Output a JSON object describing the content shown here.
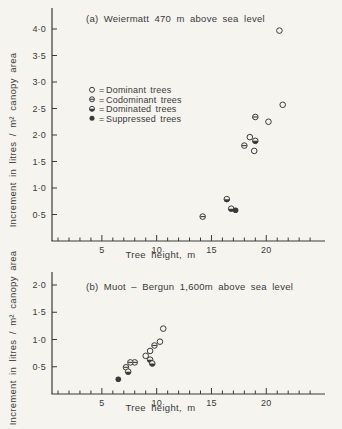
{
  "figure": {
    "background": "#f5f4ef",
    "ink": "#3a3a3a",
    "caption": "Increment per canopy area versus tree height at two elevations"
  },
  "chart_data": [
    {
      "id": "weiermatt",
      "type": "scatter",
      "title": "(a) Weiermatt 470 m above sea level",
      "xlabel": "Tree height, m",
      "ylabel": "Increment in litres / m² canopy area",
      "xlim": [
        0,
        25
      ],
      "ylim": [
        0,
        4.4
      ],
      "xticks": [
        5,
        10,
        15,
        20
      ],
      "xtick_minor_step": 1,
      "xtick_minor_max": 24,
      "yticks": [
        0.5,
        1.0,
        1.5,
        2.0,
        2.5,
        3.0,
        3.5,
        4.0
      ],
      "ytick_labels": [
        "0·5",
        "1·0",
        "1·5",
        "2·0",
        "2·5",
        "3·0",
        "3·5",
        "4·0"
      ],
      "grid": false,
      "legend": {
        "visible": true,
        "position": "upper-left-inside",
        "equals_sign": "=",
        "entries": [
          {
            "marker": "open-circle",
            "label": "Dominant trees"
          },
          {
            "marker": "circle-horizontal-bar",
            "label": "Codominant trees"
          },
          {
            "marker": "circle-bottom-half-filled",
            "label": "Dominated trees"
          },
          {
            "marker": "filled-circle",
            "label": "Suppressed trees"
          }
        ]
      },
      "series": [
        {
          "name": "Dominant trees",
          "marker": "open-circle",
          "points": [
            [
              21.2,
              3.97
            ],
            [
              21.5,
              2.57
            ],
            [
              20.2,
              2.25
            ],
            [
              18.5,
              1.96
            ],
            [
              18.9,
              1.7
            ]
          ]
        },
        {
          "name": "Codominant trees",
          "marker": "circle-horizontal-bar",
          "points": [
            [
              19.0,
              2.34
            ],
            [
              18.0,
              1.8
            ],
            [
              14.2,
              0.46
            ]
          ]
        },
        {
          "name": "Dominated trees",
          "marker": "circle-bottom-half-filled",
          "points": [
            [
              19.0,
              1.89
            ],
            [
              16.4,
              0.79
            ],
            [
              16.8,
              0.61
            ]
          ]
        },
        {
          "name": "Suppressed trees",
          "marker": "filled-circle",
          "points": [
            [
              17.2,
              0.58
            ]
          ]
        }
      ]
    },
    {
      "id": "muot-bergun",
      "type": "scatter",
      "title": "(b) Muot – Bergun 1,600m above sea level",
      "xlabel": "Tree height, m",
      "ylabel": "Increment in litres / m² canopy area",
      "xlim": [
        0,
        25
      ],
      "ylim": [
        0,
        2.2
      ],
      "xticks": [
        5,
        10,
        15,
        20
      ],
      "xtick_minor_step": 1,
      "xtick_minor_max": 24,
      "yticks": [
        0.5,
        1.0,
        1.5,
        2.0
      ],
      "ytick_labels": [
        "0·5",
        "1·0",
        "1·5",
        "2·0"
      ],
      "grid": false,
      "legend": {
        "visible": false
      },
      "series": [
        {
          "name": "Dominant trees",
          "marker": "open-circle",
          "points": [
            [
              10.6,
              1.2
            ],
            [
              10.3,
              0.96
            ],
            [
              9.4,
              0.79
            ],
            [
              9.0,
              0.7
            ]
          ]
        },
        {
          "name": "Codominant trees",
          "marker": "circle-horizontal-bar",
          "points": [
            [
              9.8,
              0.89
            ],
            [
              8.0,
              0.58
            ],
            [
              7.6,
              0.58
            ],
            [
              7.2,
              0.49
            ]
          ]
        },
        {
          "name": "Dominated trees",
          "marker": "circle-bottom-half-filled",
          "points": [
            [
              9.4,
              0.63
            ],
            [
              9.6,
              0.56
            ],
            [
              7.4,
              0.41
            ]
          ]
        },
        {
          "name": "Suppressed trees",
          "marker": "filled-circle",
          "points": [
            [
              6.5,
              0.27
            ]
          ]
        }
      ]
    }
  ]
}
